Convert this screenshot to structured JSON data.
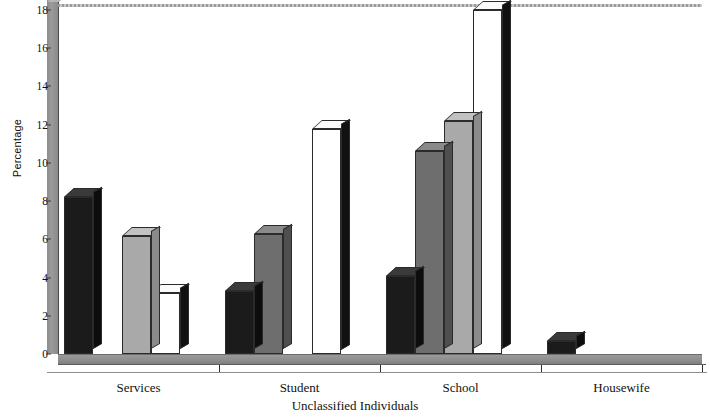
{
  "chart_data": {
    "type": "bar",
    "title": "",
    "xlabel": "Unclassified Individuals",
    "ylabel": "Percentage",
    "categories": [
      "Services",
      "Student",
      "School",
      "Housewife"
    ],
    "series": [
      {
        "name": "series-1",
        "color": "#1b1b1b",
        "values": [
          8.2,
          3.3,
          4.1,
          0.7
        ]
      },
      {
        "name": "series-2",
        "color": "#6e6e6e",
        "values": [
          0,
          6.3,
          10.6,
          0
        ]
      },
      {
        "name": "series-3",
        "color": "#a9a9a9",
        "values": [
          6.2,
          0,
          12.2,
          0
        ]
      },
      {
        "name": "series-4",
        "color": "#ffffff",
        "values": [
          3.2,
          11.8,
          18.0,
          0
        ]
      }
    ],
    "ylim": [
      0,
      18
    ],
    "yticks": [
      0,
      2,
      4,
      6,
      8,
      10,
      12,
      14,
      16,
      18
    ],
    "ytick_labels": [
      "0",
      "2",
      "4",
      "6",
      "8",
      "10",
      "12",
      "14",
      "16",
      "18"
    ],
    "grid": false,
    "legend": "none",
    "style": "3d-column"
  }
}
